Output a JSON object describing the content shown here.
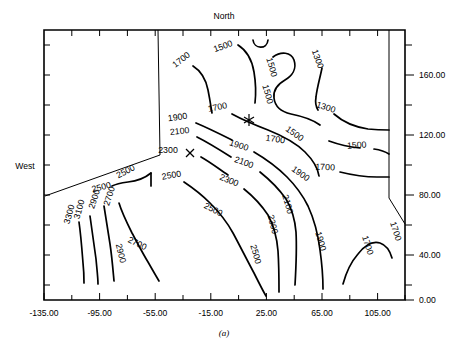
{
  "figure": {
    "caption": "(a)",
    "top_label": "North",
    "left_label": "West"
  },
  "chart_data": {
    "type": "contour",
    "title": "",
    "subtitle": "",
    "caption": "(a)",
    "xlabel": "",
    "ylabel": "",
    "grid": false,
    "legend": "none",
    "xlim": [
      -135.0,
      125.0
    ],
    "ylim": [
      0.0,
      180.0
    ],
    "x_ticks": [
      -135.0,
      -115.0,
      -95.0,
      -75.0,
      -55.0,
      -35.0,
      -15.0,
      5.0,
      25.0,
      45.0,
      65.0,
      85.0,
      105.0,
      125.0
    ],
    "x_tick_labels": [
      "-135.00",
      "",
      "-95.00",
      "",
      "-55.00",
      "",
      "-15.00",
      "",
      "25.00",
      "",
      "65.00",
      "",
      "105.00",
      ""
    ],
    "y_ticks": [
      0.0,
      20.0,
      40.0,
      60.0,
      80.0,
      100.0,
      120.0,
      140.0,
      160.0,
      180.0
    ],
    "y_tick_labels": [
      "0.00",
      "",
      "40.00",
      "",
      "80.00",
      "",
      "120.00",
      "",
      "160.00",
      ""
    ],
    "y_axis_side": "right",
    "contour_interval": 200,
    "contour_levels": [
      1300,
      1500,
      1700,
      1900,
      2100,
      2300,
      2500,
      2700,
      2900,
      3100,
      3300
    ],
    "contour_labels": [
      {
        "value": "1700",
        "x": 183,
        "y": 62,
        "rot": -38
      },
      {
        "value": "1500",
        "x": 224,
        "y": 49,
        "rot": -20
      },
      {
        "value": "1500",
        "x": 269,
        "y": 68,
        "rot": 74
      },
      {
        "value": "1500",
        "x": 265,
        "y": 95,
        "rot": 74
      },
      {
        "value": "1300",
        "x": 315,
        "y": 60,
        "rot": 70
      },
      {
        "value": "1300",
        "x": 325,
        "y": 110,
        "rot": 18
      },
      {
        "value": "1700",
        "x": 218,
        "y": 110,
        "rot": -12
      },
      {
        "value": "1500",
        "x": 293,
        "y": 136,
        "rot": 36
      },
      {
        "value": "1500",
        "x": 357,
        "y": 148,
        "rot": -4
      },
      {
        "value": "1700",
        "x": 275,
        "y": 142,
        "rot": 8
      },
      {
        "value": "1700",
        "x": 325,
        "y": 170,
        "rot": 2
      },
      {
        "value": "1900",
        "x": 178,
        "y": 120,
        "rot": -8
      },
      {
        "value": "1900",
        "x": 238,
        "y": 148,
        "rot": 18
      },
      {
        "value": "1900",
        "x": 299,
        "y": 176,
        "rot": 36
      },
      {
        "value": "2100",
        "x": 180,
        "y": 134,
        "rot": -6
      },
      {
        "value": "2100",
        "x": 243,
        "y": 165,
        "rot": 20
      },
      {
        "value": "2100",
        "x": 285,
        "y": 205,
        "rot": 74
      },
      {
        "value": "2300",
        "x": 168,
        "y": 153,
        "rot": 0
      },
      {
        "value": "2300",
        "x": 228,
        "y": 183,
        "rot": 22
      },
      {
        "value": "2300",
        "x": 270,
        "y": 225,
        "rot": 76
      },
      {
        "value": "2500",
        "x": 127,
        "y": 174,
        "rot": -28
      },
      {
        "value": "2500",
        "x": 172,
        "y": 178,
        "rot": -10
      },
      {
        "value": "2500",
        "x": 212,
        "y": 212,
        "rot": 28
      },
      {
        "value": "2500",
        "x": 253,
        "y": 255,
        "rot": 74
      },
      {
        "value": "2500",
        "x": 102,
        "y": 190,
        "rot": -14
      },
      {
        "value": "2700",
        "x": 112,
        "y": 197,
        "rot": -72
      },
      {
        "value": "2700",
        "x": 136,
        "y": 246,
        "rot": 26
      },
      {
        "value": "2900",
        "x": 97,
        "y": 200,
        "rot": -72
      },
      {
        "value": "2900",
        "x": 118,
        "y": 254,
        "rot": 76
      },
      {
        "value": "3100",
        "x": 82,
        "y": 210,
        "rot": -74
      },
      {
        "value": "3300",
        "x": 72,
        "y": 215,
        "rot": -74
      },
      {
        "value": "1900",
        "x": 318,
        "y": 242,
        "rot": 74
      },
      {
        "value": "1700",
        "x": 365,
        "y": 246,
        "rot": 72
      },
      {
        "value": "1700",
        "x": 393,
        "y": 232,
        "rot": 72
      }
    ],
    "markers": [
      {
        "type": "asterisk",
        "x": 249,
        "y": 120
      },
      {
        "type": "cross",
        "x": 190,
        "y": 153
      }
    ]
  }
}
